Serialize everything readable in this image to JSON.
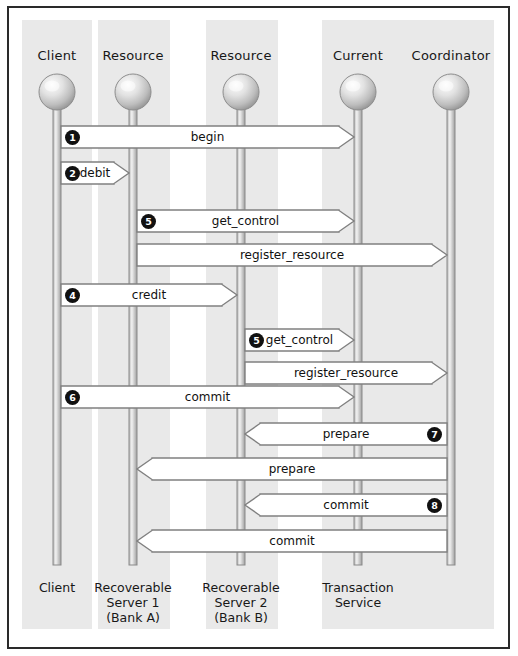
{
  "figure": {
    "kind": "uml-sequence-diagram",
    "background": "#ffffff",
    "band_color": "#e9e9e9",
    "border_color": "#2a2a2a",
    "lifeline_color": "#8a8a8a",
    "arrow_fill": "#ffffff",
    "arrow_stroke": "#808080",
    "bullet_color": "#111111"
  },
  "actors": [
    {
      "id": "client",
      "top_label": "Client",
      "x": 57,
      "foot_lines": [
        "Client"
      ]
    },
    {
      "id": "resource1",
      "top_label": "Resource",
      "x": 133,
      "foot_lines": [
        "Recoverable",
        "Server 1",
        "(Bank A)"
      ]
    },
    {
      "id": "resource2",
      "top_label": "Resource",
      "x": 241,
      "foot_lines": [
        "Recoverable",
        "Server 2",
        "(Bank B)"
      ]
    },
    {
      "id": "current",
      "top_label": "Current",
      "x": 358,
      "foot_lines": [
        "Transaction",
        "Service"
      ]
    },
    {
      "id": "coordinator",
      "top_label": "Coordinator",
      "x": 451,
      "foot_lines": []
    }
  ],
  "bands": [
    {
      "id": "band-client",
      "left": 22,
      "width": 70
    },
    {
      "id": "band-resource1",
      "left": 98,
      "width": 72
    },
    {
      "id": "band-resource2",
      "left": 206,
      "width": 72
    },
    {
      "id": "band-transaction",
      "left": 322,
      "width": 172
    }
  ],
  "messages": [
    {
      "id": "m1",
      "number": "1",
      "label": "begin",
      "from": "client",
      "to": "current",
      "direction": "right",
      "y": 137,
      "number_side": "left"
    },
    {
      "id": "m2",
      "number": "2",
      "label": "debit",
      "from": "client",
      "to": "resource1",
      "direction": "right",
      "y": 173,
      "number_side": "left"
    },
    {
      "id": "m3",
      "number": "5",
      "label": "get_control",
      "from": "resource1",
      "to": "current",
      "direction": "right",
      "y": 221,
      "number_side": "left"
    },
    {
      "id": "m4",
      "number": "",
      "label": "register_resource",
      "from": "resource1",
      "to": "coordinator",
      "direction": "right",
      "y": 255,
      "number_side": "none"
    },
    {
      "id": "m5",
      "number": "4",
      "label": "credit",
      "from": "client",
      "to": "resource2",
      "direction": "right",
      "y": 295,
      "number_side": "left"
    },
    {
      "id": "m6",
      "number": "5",
      "label": "get_control",
      "from": "resource2",
      "to": "current",
      "direction": "right",
      "y": 340,
      "number_side": "left"
    },
    {
      "id": "m7",
      "number": "",
      "label": "register_resource",
      "from": "resource2",
      "to": "coordinator",
      "direction": "right",
      "y": 373,
      "number_side": "none"
    },
    {
      "id": "m8",
      "number": "6",
      "label": "commit",
      "from": "client",
      "to": "current",
      "direction": "right",
      "y": 397,
      "number_side": "left"
    },
    {
      "id": "m9",
      "number": "7",
      "label": "prepare",
      "from": "coordinator",
      "to": "resource2",
      "direction": "left",
      "y": 434,
      "number_side": "right"
    },
    {
      "id": "m10",
      "number": "",
      "label": "prepare",
      "from": "coordinator",
      "to": "resource1",
      "direction": "left",
      "y": 469,
      "number_side": "none"
    },
    {
      "id": "m11",
      "number": "8",
      "label": "commit",
      "from": "coordinator",
      "to": "resource2",
      "direction": "left",
      "y": 505,
      "number_side": "right"
    },
    {
      "id": "m12",
      "number": "",
      "label": "commit",
      "from": "coordinator",
      "to": "resource1",
      "direction": "left",
      "y": 541,
      "number_side": "none"
    }
  ]
}
